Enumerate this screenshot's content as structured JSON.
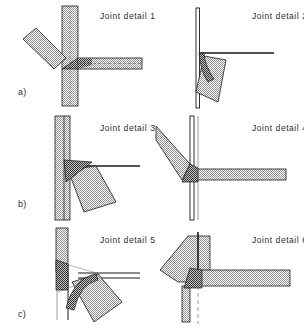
{
  "figure": {
    "width": 304,
    "height": 336,
    "background": "#ffffff",
    "line_color": "#1a1a1a",
    "light_hatch_color": "#b4b4b4",
    "dark_hatch_color": "#3a3a3a",
    "text_color": "#2b2b2b"
  },
  "row_labels": [
    {
      "id": "a",
      "text": "a)"
    },
    {
      "id": "b",
      "text": "b)"
    },
    {
      "id": "c",
      "text": "c)"
    }
  ],
  "panels": [
    {
      "id": "joint-detail-1",
      "label": "Joint detail 1",
      "row": "a",
      "column": "left",
      "members": [
        {
          "name": "column",
          "orientation": "vertical",
          "hatch": "light"
        },
        {
          "name": "beam",
          "orientation": "horizontal-right",
          "hatch": "light"
        },
        {
          "name": "brace",
          "orientation": "diagonal-upper-left",
          "hatch": "light"
        },
        {
          "name": "gusset",
          "orientation": "triangular",
          "hatch": "dark"
        }
      ]
    },
    {
      "id": "joint-detail-2",
      "label": "Joint detail 2",
      "row": "a",
      "column": "right",
      "members": [
        {
          "name": "column",
          "orientation": "vertical",
          "hatch": "outline"
        },
        {
          "name": "beam",
          "orientation": "horizontal-right",
          "hatch": "outline"
        },
        {
          "name": "brace",
          "orientation": "diagonal-lower-right",
          "hatch": "light"
        },
        {
          "name": "haunch",
          "orientation": "curved",
          "hatch": "dark"
        }
      ]
    },
    {
      "id": "joint-detail-3",
      "label": "Joint detail 3",
      "row": "b",
      "column": "left",
      "members": [
        {
          "name": "column",
          "orientation": "vertical",
          "hatch": "light"
        },
        {
          "name": "beam",
          "orientation": "horizontal-right",
          "hatch": "outline"
        },
        {
          "name": "brace",
          "orientation": "diagonal-lower-right",
          "hatch": "light"
        },
        {
          "name": "gusset",
          "orientation": "triangular",
          "hatch": "dark"
        }
      ]
    },
    {
      "id": "joint-detail-4",
      "label": "Joint detail 4",
      "row": "b",
      "column": "right",
      "members": [
        {
          "name": "column",
          "orientation": "vertical",
          "hatch": "outline"
        },
        {
          "name": "beam",
          "orientation": "horizontal-right",
          "hatch": "light"
        },
        {
          "name": "brace",
          "orientation": "diagonal-upper-left",
          "hatch": "light"
        },
        {
          "name": "gusset",
          "orientation": "triangular",
          "hatch": "dark"
        }
      ]
    },
    {
      "id": "joint-detail-5",
      "label": "Joint detail 5",
      "row": "c",
      "column": "left",
      "members": [
        {
          "name": "column",
          "orientation": "vertical",
          "hatch": "light"
        },
        {
          "name": "beam",
          "orientation": "horizontal-right",
          "hatch": "outline"
        },
        {
          "name": "brace",
          "orientation": "diagonal-lower-right",
          "hatch": "light"
        },
        {
          "name": "gusset",
          "orientation": "triangular",
          "hatch": "dark"
        },
        {
          "name": "haunch",
          "orientation": "curved",
          "hatch": "dark"
        }
      ]
    },
    {
      "id": "joint-detail-6",
      "label": "Joint detail 6",
      "row": "c",
      "column": "right",
      "members": [
        {
          "name": "column",
          "orientation": "vertical",
          "hatch": "light"
        },
        {
          "name": "beam",
          "orientation": "horizontal-right",
          "hatch": "light"
        },
        {
          "name": "brace",
          "orientation": "diagonal-upper-left",
          "hatch": "light"
        },
        {
          "name": "gusset",
          "orientation": "triangular",
          "hatch": "dark"
        },
        {
          "name": "centerline",
          "orientation": "vertical-dashed",
          "hatch": "none"
        }
      ]
    }
  ]
}
